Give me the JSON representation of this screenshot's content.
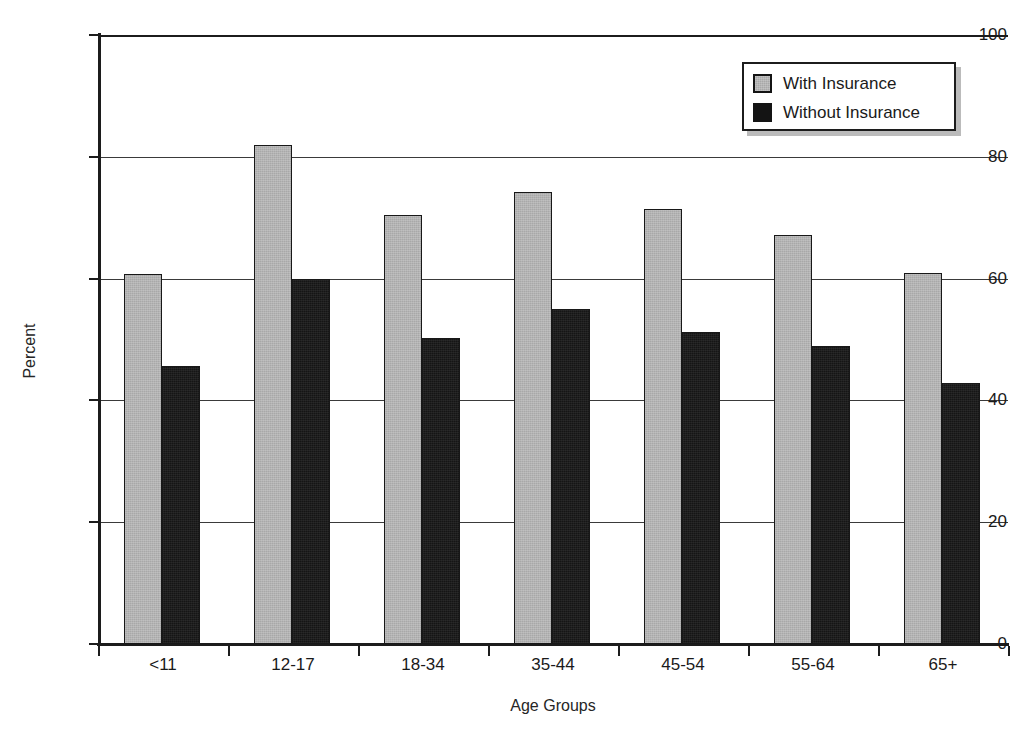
{
  "chart_data": {
    "type": "bar",
    "title": "",
    "subtitle": "",
    "xlabel": "Age Groups",
    "ylabel": "Percent",
    "categories": [
      "<11",
      "12-17",
      "18-34",
      "35-44",
      "45-54",
      "55-64",
      "65+"
    ],
    "series": [
      {
        "name": "With Insurance",
        "color": "#a8a8a8",
        "values": [
          60.8,
          82.0,
          70.4,
          74.2,
          71.4,
          67.2,
          61.0
        ]
      },
      {
        "name": "Without Insurance",
        "color": "#151515",
        "values": [
          45.6,
          60.0,
          50.3,
          55.0,
          51.2,
          49.0,
          42.8
        ]
      }
    ],
    "ylim": [
      0,
      100
    ],
    "yticks": [
      0,
      20,
      40,
      60,
      80,
      100
    ],
    "ytick_labels": [
      "0",
      "20",
      "40",
      "60",
      "80",
      "100"
    ],
    "grid": "horizontal",
    "legend_position": "top-right",
    "annotations": []
  },
  "legend": {
    "entries": [
      {
        "label": "With Insurance",
        "swatch": "gray-square-icon"
      },
      {
        "label": "Without Insurance",
        "swatch": "black-square-icon"
      }
    ]
  }
}
